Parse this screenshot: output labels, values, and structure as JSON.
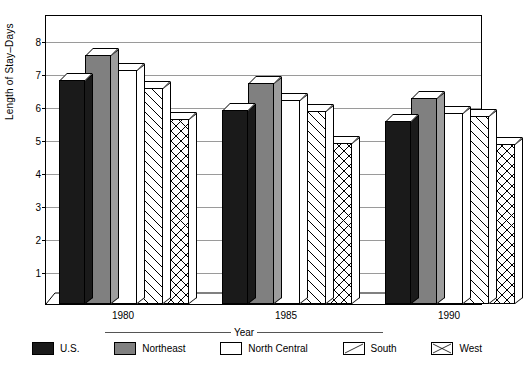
{
  "chart_data": {
    "type": "bar",
    "title": "",
    "xlabel": "Year",
    "ylabel": "Length of Stay–Days",
    "categories": [
      "1980",
      "1985",
      "1990"
    ],
    "ylim": [
      0,
      8.8
    ],
    "yticks": [
      1,
      2,
      3,
      4,
      5,
      6,
      7,
      8
    ],
    "ytick_labels": [
      "1",
      "2",
      "3",
      "4",
      "5",
      "6",
      "7",
      "8"
    ],
    "grid": true,
    "legend_position": "bottom",
    "style": "3d-grouped-bar",
    "series": [
      {
        "name": "U.S.",
        "pattern": "solid-black",
        "color": "#1a1a1a",
        "values": [
          6.8,
          5.9,
          5.55
        ]
      },
      {
        "name": "Northeast",
        "pattern": "solid-gray",
        "color": "#808080",
        "values": [
          7.55,
          6.7,
          6.25
        ]
      },
      {
        "name": "North Central",
        "pattern": "white",
        "color": "#ffffff",
        "values": [
          7.1,
          6.2,
          5.8
        ]
      },
      {
        "name": "South",
        "pattern": "diagonal",
        "color": "#ffffff",
        "values": [
          6.55,
          5.85,
          5.7
        ]
      },
      {
        "name": "West",
        "pattern": "crosshatch",
        "color": "#ffffff",
        "values": [
          5.6,
          4.9,
          4.85
        ]
      }
    ]
  },
  "axes": {
    "y_title": "Length of Stay–Days",
    "x_title": "Year"
  }
}
